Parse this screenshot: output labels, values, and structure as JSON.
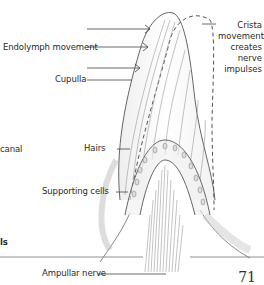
{
  "diagram": {
    "labels": {
      "endolymph": "Endolymph movement",
      "cupulla": "Cupulla",
      "hairs": "Hairs",
      "supporting_cells": "Supporting cells",
      "ampullar_nerve": "Ampullar nerve",
      "canal_fragment": "canal",
      "cells_fragment": "ls",
      "crista": [
        "Crista",
        "movement",
        "creates",
        "nerve",
        "impulses"
      ]
    },
    "page_number": "71"
  }
}
